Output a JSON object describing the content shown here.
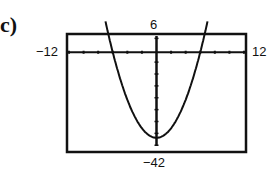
{
  "part_label": "c)",
  "window": {
    "xmin_label": "−12",
    "xmax_label": "12",
    "ymax_label": "6",
    "ymin_label": "−42"
  },
  "chart_data": {
    "type": "line",
    "title": "",
    "xlabel": "",
    "ylabel": "",
    "xlim": [
      -12,
      12
    ],
    "ylim": [
      -42,
      6
    ],
    "xscl": 2,
    "yscl": 5,
    "grid": false,
    "legend": null,
    "series": [
      {
        "name": "parabola",
        "description": "Upward-opening parabola with vertex near (0, -36), x-intercepts near ±6",
        "x": [
          -7,
          -6,
          -4,
          -2,
          0,
          2,
          4,
          6,
          7
        ],
        "y": [
          6,
          0,
          -20,
          -32,
          -36,
          -32,
          -20,
          0,
          6
        ]
      }
    ]
  }
}
